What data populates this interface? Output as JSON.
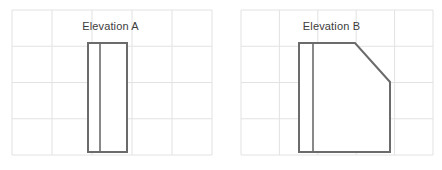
{
  "canvas": {
    "width": 442,
    "height": 170,
    "background": "#ffffff"
  },
  "style": {
    "grid_color": "#e2e2e2",
    "grid_stroke_width": 1,
    "shape_stroke_color": "#6b6b6b",
    "shape_divider_color": "#6b6b6b",
    "shape_fill": "#ffffff",
    "shape_stroke_width": 2,
    "divider_stroke_width": 1.6,
    "caption_color": "#3c3c3c"
  },
  "panels": [
    {
      "id": "elevation-a",
      "caption": "Elevation A",
      "grid": {
        "x": 12,
        "y": 10,
        "width": 200,
        "height": 145,
        "columns": 5,
        "rows": 4
      },
      "shape": {
        "type": "rectangle-with-divider",
        "points": "88,43 127,43 127,152 88,152",
        "divider": "100,43 100,152"
      }
    },
    {
      "id": "elevation-b",
      "caption": "Elevation B",
      "grid": {
        "x": 20,
        "y": 10,
        "width": 192,
        "height": 145,
        "columns": 5,
        "rows": 4
      },
      "shape": {
        "type": "chamfered-rectangle-with-divider",
        "points": "78,43 134,43 169,82 169,152 78,152",
        "divider": "92,43 92,152"
      }
    }
  ]
}
